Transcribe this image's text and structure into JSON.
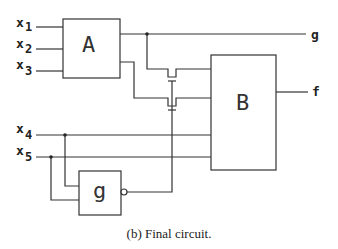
{
  "diagram": {
    "type": "logic-circuit",
    "inputs": [
      {
        "name": "x",
        "sub": "1"
      },
      {
        "name": "x",
        "sub": "2"
      },
      {
        "name": "x",
        "sub": "3"
      },
      {
        "name": "x",
        "sub": "4"
      },
      {
        "name": "x",
        "sub": "5"
      }
    ],
    "blocks": {
      "a": {
        "label": "A"
      },
      "b": {
        "label": "B"
      },
      "g": {
        "label": "g"
      }
    },
    "outputs": {
      "g": {
        "label": "g"
      },
      "f": {
        "label": "f"
      }
    },
    "caption": "(b) Final circuit.",
    "colors": {
      "wire": "#333333",
      "background": "#ffffff"
    }
  }
}
